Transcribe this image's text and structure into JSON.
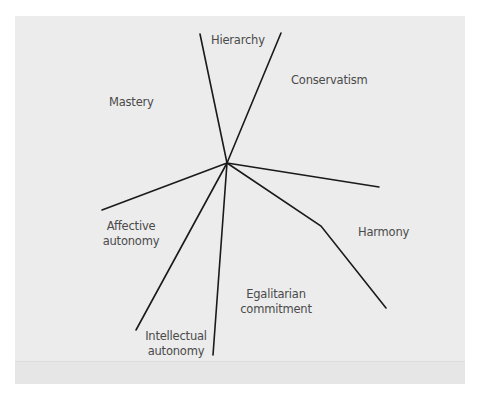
{
  "diagram": {
    "center": [
      227,
      163
    ],
    "line_color": "#1a1a1a",
    "background": "#ececec",
    "labels": {
      "hierarchy": "Hierarchy",
      "conservatism": "Conservatism",
      "mastery": "Mastery",
      "affective_1": "Affective",
      "affective_2": "autonomy",
      "harmony": "Harmony",
      "egalitarian_1": "Egalitarian",
      "egalitarian_2": "commitment",
      "intellectual_1": "Intellectual",
      "intellectual_2": "autonomy"
    },
    "regions": [
      "Hierarchy",
      "Conservatism",
      "Harmony",
      "Egalitarian commitment",
      "Intellectual autonomy",
      "Affective autonomy",
      "Mastery"
    ]
  }
}
